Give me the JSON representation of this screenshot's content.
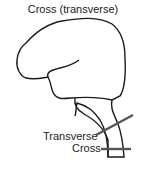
{
  "diagram": {
    "title": "Cross (transverse)",
    "labels": {
      "transverse": "Transverse",
      "cross": "Cross"
    },
    "colors": {
      "outline": "#1a1a1a",
      "plane": "#555555"
    }
  }
}
